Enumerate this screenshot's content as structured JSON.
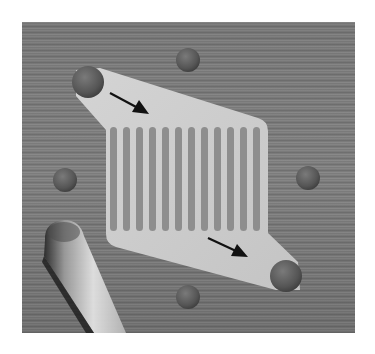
{
  "figure": {
    "colors": {
      "background": "#ffffff",
      "surface": "#7d7d7d",
      "surface_dark": "#5e5e5e",
      "chip": "#c9c9c9",
      "chip_highlight": "#d9d9d9",
      "channel": "#8a8a8a",
      "reservoir": "#5a5a5a",
      "arrow": "#111111",
      "pipette": "#bdbdbd"
    },
    "pillars": {
      "count": 12
    },
    "spots": [
      {
        "name": "top",
        "cx": 188,
        "cy": 60,
        "r": 12
      },
      {
        "name": "left",
        "cx": 65,
        "cy": 180,
        "r": 12
      },
      {
        "name": "right",
        "cx": 308,
        "cy": 178,
        "r": 12
      },
      {
        "name": "bottom",
        "cx": 188,
        "cy": 297,
        "r": 12
      }
    ],
    "reservoirs": [
      {
        "name": "inlet",
        "cx": 88,
        "cy": 82,
        "r": 16
      },
      {
        "name": "outlet",
        "cx": 286,
        "cy": 276,
        "r": 16
      }
    ],
    "arrows": [
      {
        "name": "inflow",
        "x1": 110,
        "y1": 93,
        "x2": 148,
        "y2": 113
      },
      {
        "name": "outflow",
        "x1": 208,
        "y1": 238,
        "x2": 247,
        "y2": 256
      }
    ]
  }
}
